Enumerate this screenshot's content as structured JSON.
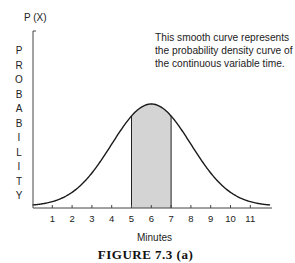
{
  "chart_data": {
    "type": "area",
    "title": "",
    "xlabel": "Minutes",
    "ylabel": "PROBABILITY",
    "y_axis_title": "P (X)",
    "x_ticks": [
      1,
      2,
      3,
      4,
      5,
      6,
      7,
      8,
      9,
      10,
      11
    ],
    "xlim": [
      0,
      12
    ],
    "curve": "normal density, mean 6",
    "mean": 6,
    "shaded_interval": [
      5,
      7
    ],
    "grid": false,
    "legend": null,
    "annotation": "This smooth curve represents the probability density curve of the continuous variable time.",
    "caption": "FIGURE 7.3 (a)",
    "colors": {
      "line": "#1a1a1a",
      "shade": "#d4d4d4"
    }
  },
  "labels": {
    "y_axis_title": "P (X)",
    "ylabel_letters": [
      "P",
      "R",
      "O",
      "B",
      "A",
      "B",
      "I",
      "L",
      "I",
      "T",
      "Y"
    ],
    "note_lines": [
      "This smooth curve represents",
      "the probability density curve of",
      "the continuous variable time."
    ],
    "xlabel": "Minutes",
    "caption": "FIGURE 7.3 (a)",
    "ticks": [
      "1",
      "2",
      "3",
      "4",
      "5",
      "6",
      "7",
      "8",
      "9",
      "10",
      "11"
    ]
  }
}
